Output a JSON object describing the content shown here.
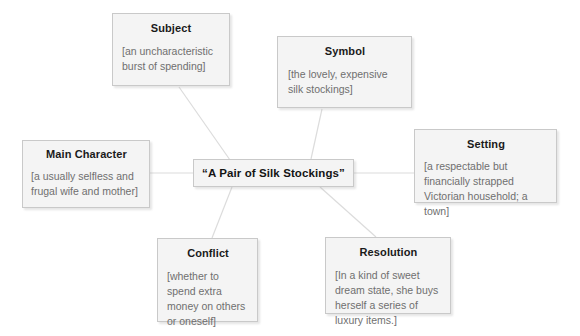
{
  "diagram": {
    "type": "concept-map",
    "background_color": "#ffffff",
    "box_fill_color": "#f4f4f4",
    "box_border_color": "#c9c9c9",
    "connector_color": "#dcdcdc",
    "title_color": "#1a1a1a",
    "body_color": "#6f6f6f",
    "center": {
      "title": "“A Pair of Silk Stockings”"
    },
    "nodes": [
      {
        "id": "subject",
        "title": "Subject",
        "body": "[an uncharacteristic burst of spending]"
      },
      {
        "id": "symbol",
        "title": "Symbol",
        "body": "[the lovely, expensive silk stockings]"
      },
      {
        "id": "setting",
        "title": "Setting",
        "body": "[a respectable but financially strapped Victorian household; a town]"
      },
      {
        "id": "main-character",
        "title": "Main Character",
        "body": "[a usually selfless and frugal wife and mother]"
      },
      {
        "id": "conflict",
        "title": "Conflict",
        "body": "[whether to spend extra money on others or oneself]"
      },
      {
        "id": "resolution",
        "title": "Resolution",
        "body": "[In a kind of sweet dream state, she buys herself a series of luxury items.]"
      }
    ],
    "connectors": [
      {
        "from": "subject",
        "to": "center"
      },
      {
        "from": "symbol",
        "to": "center"
      },
      {
        "from": "setting",
        "to": "center"
      },
      {
        "from": "main-character",
        "to": "center"
      },
      {
        "from": "conflict",
        "to": "center"
      },
      {
        "from": "resolution",
        "to": "center"
      }
    ]
  }
}
